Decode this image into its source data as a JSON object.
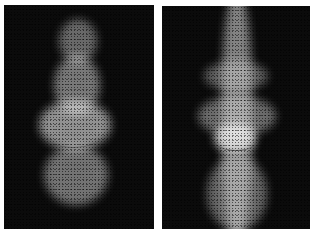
{
  "figure": {
    "panels": [
      {
        "id": "left",
        "description": "scattered-light pattern shaped like a bottle/vase with elliptical rim near lower third"
      },
      {
        "id": "right",
        "description": "scattered-light pattern with vertical beam and lobes around an elliptical rim"
      }
    ],
    "colors": {
      "background": "#0b0b0b",
      "light": "#e8e8e8",
      "page": "#ffffff"
    }
  }
}
